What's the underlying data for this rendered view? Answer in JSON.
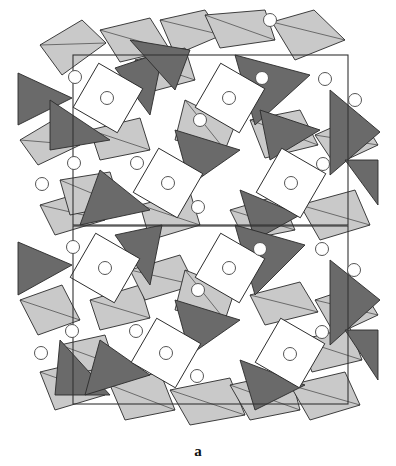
{
  "figure": {
    "caption": "a",
    "colors": {
      "background": "#ffffff",
      "octahedron": "#c9c9c9",
      "tetrahedron": "#6a6a6a",
      "cavity": "#ffffff",
      "edge": "#2a2a2a",
      "atom_stroke": "#555555",
      "cell": "#333333"
    },
    "unit_cells": [
      {
        "x": 73,
        "y": 55,
        "w": 275,
        "h": 170
      },
      {
        "x": 73,
        "y": 226,
        "w": 275,
        "h": 178
      }
    ],
    "cavities": [
      {
        "cx": 108,
        "cy": 98,
        "r": 36
      },
      {
        "cx": 230,
        "cy": 98,
        "r": 36
      },
      {
        "cx": 168,
        "cy": 183,
        "r": 36
      },
      {
        "cx": 291,
        "cy": 183,
        "r": 36
      },
      {
        "cx": 105,
        "cy": 268,
        "r": 36
      },
      {
        "cx": 230,
        "cy": 268,
        "r": 36
      },
      {
        "cx": 166,
        "cy": 353,
        "r": 36
      },
      {
        "cx": 290,
        "cy": 353,
        "r": 36
      }
    ],
    "atoms": [
      {
        "cx": 75,
        "cy": 77
      },
      {
        "cx": 107,
        "cy": 98
      },
      {
        "cx": 229,
        "cy": 98
      },
      {
        "cx": 262,
        "cy": 78
      },
      {
        "cx": 325,
        "cy": 79
      },
      {
        "cx": 355,
        "cy": 100
      },
      {
        "cx": 200,
        "cy": 120
      },
      {
        "cx": 42,
        "cy": 184
      },
      {
        "cx": 74,
        "cy": 163
      },
      {
        "cx": 137,
        "cy": 163
      },
      {
        "cx": 168,
        "cy": 183
      },
      {
        "cx": 291,
        "cy": 183
      },
      {
        "cx": 323,
        "cy": 164
      },
      {
        "cx": 198,
        "cy": 207
      },
      {
        "cx": 73,
        "cy": 247
      },
      {
        "cx": 105,
        "cy": 268
      },
      {
        "cx": 260,
        "cy": 249
      },
      {
        "cx": 229,
        "cy": 268
      },
      {
        "cx": 322,
        "cy": 249
      },
      {
        "cx": 354,
        "cy": 270
      },
      {
        "cx": 198,
        "cy": 290
      },
      {
        "cx": 41,
        "cy": 353
      },
      {
        "cx": 72,
        "cy": 331
      },
      {
        "cx": 136,
        "cy": 331
      },
      {
        "cx": 166,
        "cy": 353
      },
      {
        "cx": 290,
        "cy": 354
      },
      {
        "cx": 322,
        "cy": 332
      },
      {
        "cx": 197,
        "cy": 376
      },
      {
        "cx": 270,
        "cy": 20
      }
    ],
    "tetrahedra": [
      [
        [
          18,
          73
        ],
        [
          72,
          98
        ],
        [
          18,
          125
        ]
      ],
      [
        [
          115,
          68
        ],
        [
          163,
          52
        ],
        [
          150,
          115
        ]
      ],
      [
        [
          235,
          55
        ],
        [
          310,
          75
        ],
        [
          255,
          125
        ]
      ],
      [
        [
          330,
          90
        ],
        [
          380,
          132
        ],
        [
          330,
          175
        ]
      ],
      [
        [
          50,
          100
        ],
        [
          110,
          140
        ],
        [
          50,
          150
        ]
      ],
      [
        [
          175,
          130
        ],
        [
          240,
          150
        ],
        [
          190,
          185
        ]
      ],
      [
        [
          100,
          170
        ],
        [
          150,
          210
        ],
        [
          80,
          225
        ]
      ],
      [
        [
          240,
          190
        ],
        [
          300,
          215
        ],
        [
          255,
          240
        ]
      ],
      [
        [
          345,
          160
        ],
        [
          378,
          160
        ],
        [
          378,
          205
        ]
      ],
      [
        [
          18,
          242
        ],
        [
          72,
          265
        ],
        [
          18,
          295
        ]
      ],
      [
        [
          115,
          235
        ],
        [
          162,
          225
        ],
        [
          150,
          285
        ]
      ],
      [
        [
          235,
          225
        ],
        [
          305,
          245
        ],
        [
          255,
          295
        ]
      ],
      [
        [
          330,
          260
        ],
        [
          380,
          300
        ],
        [
          330,
          345
        ]
      ],
      [
        [
          60,
          340
        ],
        [
          110,
          395
        ],
        [
          55,
          395
        ]
      ],
      [
        [
          175,
          300
        ],
        [
          240,
          320
        ],
        [
          190,
          355
        ]
      ],
      [
        [
          100,
          340
        ],
        [
          150,
          375
        ],
        [
          85,
          395
        ]
      ],
      [
        [
          240,
          360
        ],
        [
          305,
          385
        ],
        [
          255,
          410
        ]
      ],
      [
        [
          345,
          330
        ],
        [
          378,
          330
        ],
        [
          378,
          380
        ]
      ],
      [
        [
          130,
          40
        ],
        [
          190,
          50
        ],
        [
          175,
          90
        ]
      ],
      [
        [
          260,
          110
        ],
        [
          320,
          130
        ],
        [
          270,
          160
        ]
      ]
    ],
    "octahedra": [
      [
        [
          40,
          45
        ],
        [
          82,
          20
        ],
        [
          106,
          43
        ],
        [
          62,
          75
        ]
      ],
      [
        [
          100,
          30
        ],
        [
          150,
          18
        ],
        [
          170,
          50
        ],
        [
          120,
          62
        ]
      ],
      [
        [
          160,
          20
        ],
        [
          205,
          10
        ],
        [
          222,
          35
        ],
        [
          175,
          55
        ]
      ],
      [
        [
          205,
          15
        ],
        [
          265,
          10
        ],
        [
          275,
          40
        ],
        [
          220,
          48
        ]
      ],
      [
        [
          272,
          22
        ],
        [
          314,
          10
        ],
        [
          345,
          40
        ],
        [
          295,
          60
        ]
      ],
      [
        [
          20,
          140
        ],
        [
          62,
          115
        ],
        [
          80,
          145
        ],
        [
          38,
          165
        ]
      ],
      [
        [
          90,
          130
        ],
        [
          140,
          118
        ],
        [
          150,
          150
        ],
        [
          100,
          160
        ]
      ],
      [
        [
          250,
          120
        ],
        [
          300,
          110
        ],
        [
          318,
          145
        ],
        [
          265,
          158
        ]
      ],
      [
        [
          315,
          135
        ],
        [
          360,
          115
        ],
        [
          378,
          145
        ],
        [
          335,
          165
        ]
      ],
      [
        [
          40,
          205
        ],
        [
          90,
          190
        ],
        [
          105,
          220
        ],
        [
          55,
          235
        ]
      ],
      [
        [
          140,
          205
        ],
        [
          190,
          192
        ],
        [
          200,
          225
        ],
        [
          150,
          240
        ]
      ],
      [
        [
          230,
          210
        ],
        [
          280,
          195
        ],
        [
          295,
          230
        ],
        [
          245,
          240
        ]
      ],
      [
        [
          300,
          205
        ],
        [
          355,
          190
        ],
        [
          370,
          225
        ],
        [
          320,
          240
        ]
      ],
      [
        [
          20,
          300
        ],
        [
          62,
          285
        ],
        [
          80,
          320
        ],
        [
          38,
          335
        ]
      ],
      [
        [
          90,
          300
        ],
        [
          140,
          285
        ],
        [
          150,
          318
        ],
        [
          100,
          330
        ]
      ],
      [
        [
          250,
          295
        ],
        [
          300,
          282
        ],
        [
          318,
          312
        ],
        [
          265,
          325
        ]
      ],
      [
        [
          315,
          300
        ],
        [
          360,
          285
        ],
        [
          378,
          315
        ],
        [
          335,
          335
        ]
      ],
      [
        [
          40,
          372
        ],
        [
          90,
          360
        ],
        [
          105,
          395
        ],
        [
          55,
          410
        ]
      ],
      [
        [
          110,
          385
        ],
        [
          160,
          372
        ],
        [
          175,
          410
        ],
        [
          125,
          420
        ]
      ],
      [
        [
          170,
          390
        ],
        [
          230,
          378
        ],
        [
          245,
          415
        ],
        [
          190,
          425
        ]
      ],
      [
        [
          230,
          385
        ],
        [
          290,
          372
        ],
        [
          300,
          410
        ],
        [
          250,
          420
        ]
      ],
      [
        [
          290,
          385
        ],
        [
          345,
          372
        ],
        [
          360,
          405
        ],
        [
          310,
          420
        ]
      ],
      [
        [
          135,
          60
        ],
        [
          185,
          48
        ],
        [
          195,
          80
        ],
        [
          150,
          92
        ]
      ],
      [
        [
          185,
          100
        ],
        [
          235,
          125
        ],
        [
          225,
          150
        ],
        [
          175,
          140
        ]
      ],
      [
        [
          130,
          270
        ],
        [
          180,
          255
        ],
        [
          195,
          285
        ],
        [
          145,
          300
        ]
      ],
      [
        [
          185,
          270
        ],
        [
          235,
          290
        ],
        [
          225,
          320
        ],
        [
          175,
          310
        ]
      ],
      [
        [
          60,
          180
        ],
        [
          110,
          172
        ],
        [
          120,
          205
        ],
        [
          70,
          215
        ]
      ],
      [
        [
          300,
          340
        ],
        [
          350,
          328
        ],
        [
          362,
          360
        ],
        [
          312,
          372
        ]
      ],
      [
        [
          60,
          345
        ],
        [
          105,
          335
        ],
        [
          115,
          365
        ],
        [
          70,
          375
        ]
      ]
    ]
  }
}
